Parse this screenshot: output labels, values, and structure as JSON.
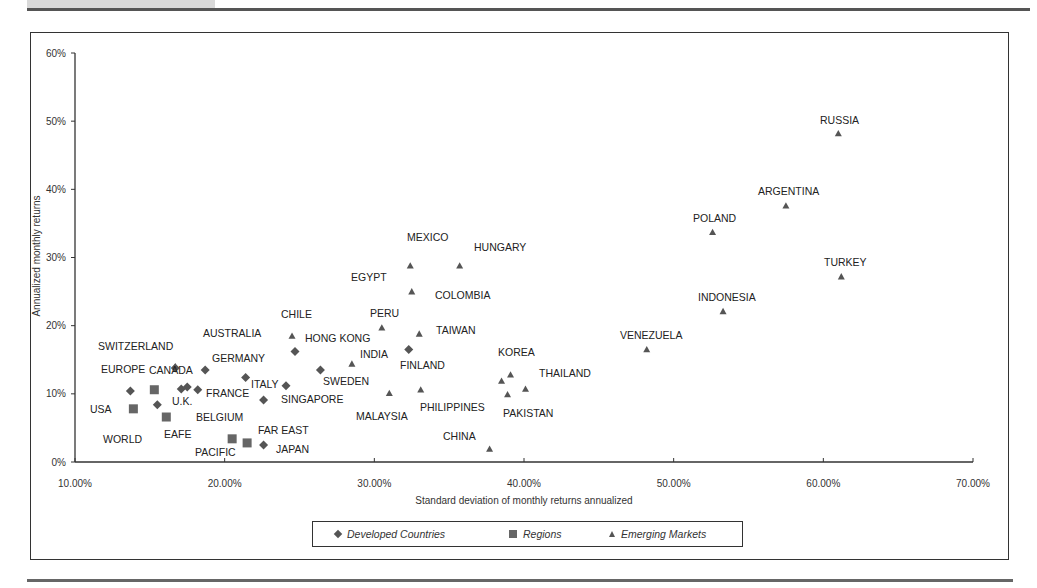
{
  "chart_data": {
    "type": "scatter",
    "title": "",
    "xlabel": "Standard deviation of monthly returns annualized",
    "ylabel": "Annualized monthly returns",
    "xlim": [
      10,
      70
    ],
    "ylim": [
      0,
      60
    ],
    "x_ticks": [
      "10.00%",
      "20.00%",
      "30.00%",
      "40.00%",
      "50.00%",
      "60.00%",
      "70.00%"
    ],
    "y_ticks": [
      "0%",
      "10%",
      "20%",
      "30%",
      "40%",
      "50%",
      "60%"
    ],
    "grid": false,
    "legend_position": "bottom",
    "legend": [
      "Developed Countries",
      "Regions",
      "Emerging Markets"
    ],
    "series": [
      {
        "name": "Developed Countries",
        "marker": "diamond",
        "points": [
          {
            "x": 13.7,
            "y": 10.4
          },
          {
            "x": 16.7,
            "y": 13.8
          },
          {
            "x": 15.5,
            "y": 8.4
          },
          {
            "x": 17.1,
            "y": 10.7
          },
          {
            "x": 17.5,
            "y": 11.0
          },
          {
            "x": 18.2,
            "y": 10.6
          },
          {
            "x": 18.7,
            "y": 13.5
          },
          {
            "x": 21.4,
            "y": 12.4
          },
          {
            "x": 22.6,
            "y": 9.1
          },
          {
            "x": 24.1,
            "y": 11.2
          },
          {
            "x": 22.6,
            "y": 2.5
          },
          {
            "x": 24.7,
            "y": 16.2
          },
          {
            "x": 26.4,
            "y": 13.5
          },
          {
            "x": 32.3,
            "y": 16.5
          }
        ]
      },
      {
        "name": "Regions",
        "marker": "square",
        "points": [
          {
            "x": 13.9,
            "y": 7.8
          },
          {
            "x": 15.3,
            "y": 10.6
          },
          {
            "x": 16.1,
            "y": 6.6
          },
          {
            "x": 20.5,
            "y": 3.4
          },
          {
            "x": 21.5,
            "y": 2.8
          }
        ]
      },
      {
        "name": "Emerging Markets",
        "marker": "triangle",
        "points": [
          {
            "x": 16.7,
            "y": 14.0
          },
          {
            "x": 24.5,
            "y": 18.5
          },
          {
            "x": 28.5,
            "y": 14.4
          },
          {
            "x": 30.5,
            "y": 19.7
          },
          {
            "x": 32.4,
            "y": 28.8
          },
          {
            "x": 35.7,
            "y": 28.8
          },
          {
            "x": 32.5,
            "y": 25.0
          },
          {
            "x": 33.0,
            "y": 18.8
          },
          {
            "x": 31.0,
            "y": 10.1
          },
          {
            "x": 33.1,
            "y": 10.6
          },
          {
            "x": 39.1,
            "y": 12.8
          },
          {
            "x": 38.5,
            "y": 11.9
          },
          {
            "x": 40.1,
            "y": 10.7
          },
          {
            "x": 38.9,
            "y": 9.9
          },
          {
            "x": 37.7,
            "y": 1.9
          },
          {
            "x": 48.2,
            "y": 16.5
          },
          {
            "x": 53.3,
            "y": 22.1
          },
          {
            "x": 52.6,
            "y": 33.7
          },
          {
            "x": 57.5,
            "y": 37.6
          },
          {
            "x": 61.0,
            "y": 48.2
          },
          {
            "x": 61.2,
            "y": 27.2
          }
        ]
      }
    ],
    "annotations": [
      {
        "text": "RUSSIA",
        "px": 820,
        "py": 124
      },
      {
        "text": "ARGENTINA",
        "px": 758,
        "py": 195
      },
      {
        "text": "POLAND",
        "px": 693,
        "py": 222
      },
      {
        "text": "TURKEY",
        "px": 824,
        "py": 266
      },
      {
        "text": "INDONESIA",
        "px": 698,
        "py": 301
      },
      {
        "text": "VENEZUELA",
        "px": 620,
        "py": 339
      },
      {
        "text": "MEXICO",
        "px": 407,
        "py": 241
      },
      {
        "text": "HUNGARY",
        "px": 474,
        "py": 251
      },
      {
        "text": "EGYPT",
        "px": 351,
        "py": 281
      },
      {
        "text": "COLOMBIA",
        "px": 435,
        "py": 299
      },
      {
        "text": "PERU",
        "px": 370,
        "py": 317
      },
      {
        "text": "TAIWAN",
        "px": 436,
        "py": 334
      },
      {
        "text": "CHILE",
        "px": 281,
        "py": 318
      },
      {
        "text": "HONG KONG",
        "px": 305,
        "py": 342
      },
      {
        "text": "AUSTRALIA",
        "px": 203,
        "py": 337
      },
      {
        "text": "INDIA",
        "px": 360,
        "py": 358
      },
      {
        "text": "KOREA",
        "px": 498,
        "py": 356
      },
      {
        "text": "FINLAND",
        "px": 400,
        "py": 369
      },
      {
        "text": "THAILAND",
        "px": 539,
        "py": 377
      },
      {
        "text": "SWITZERLAND",
        "px": 98,
        "py": 350
      },
      {
        "text": "GERMANY",
        "px": 212,
        "py": 362
      },
      {
        "text": "EUROPE",
        "px": 101,
        "py": 373
      },
      {
        "text": "CANADA",
        "px": 149,
        "py": 374
      },
      {
        "text": "ITALY",
        "px": 251,
        "py": 388
      },
      {
        "text": "SWEDEN",
        "px": 323,
        "py": 385
      },
      {
        "text": "FRANCE",
        "px": 206,
        "py": 397
      },
      {
        "text": "U.K.",
        "px": 172,
        "py": 405
      },
      {
        "text": "SINGAPORE",
        "px": 281,
        "py": 403
      },
      {
        "text": "PHILIPPINES",
        "px": 420,
        "py": 411
      },
      {
        "text": "USA",
        "px": 90,
        "py": 413
      },
      {
        "text": "PAKISTAN",
        "px": 503,
        "py": 417
      },
      {
        "text": "MALAYSIA",
        "px": 356,
        "py": 420
      },
      {
        "text": "BELGIUM",
        "px": 196,
        "py": 421
      },
      {
        "text": "CHINA",
        "px": 443,
        "py": 440
      },
      {
        "text": "EAFE",
        "px": 164,
        "py": 438
      },
      {
        "text": "FAR EAST",
        "px": 258,
        "py": 434
      },
      {
        "text": "WORLD",
        "px": 103,
        "py": 443
      },
      {
        "text": "JAPAN",
        "px": 276,
        "py": 453
      },
      {
        "text": "PACIFIC",
        "px": 195,
        "py": 456
      }
    ]
  },
  "legend": {
    "items": [
      {
        "label": "Developed Countries",
        "marker": "diamond"
      },
      {
        "label": "Regions",
        "marker": "square"
      },
      {
        "label": "Emerging Markets",
        "marker": "triangle"
      }
    ]
  },
  "colors": {
    "marker": "#555555",
    "axis": "#333333",
    "frame": "#333333"
  }
}
